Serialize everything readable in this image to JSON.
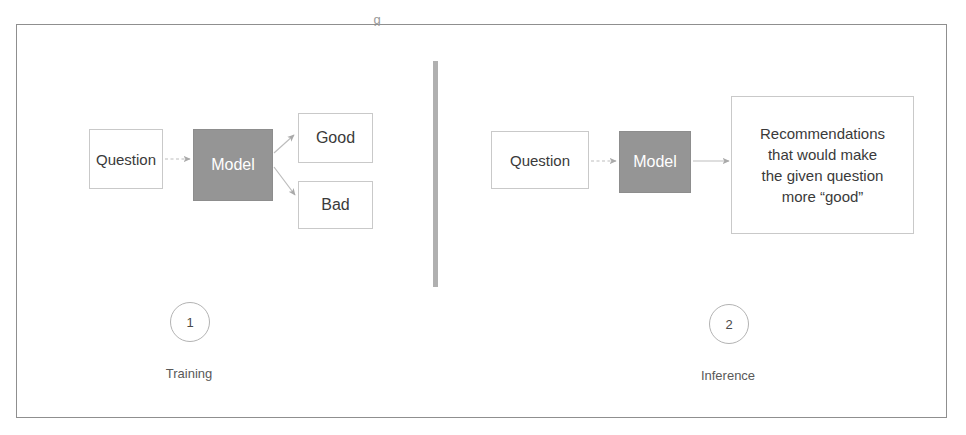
{
  "figure": {
    "cropped_caption_fragment": "g",
    "divider_color": "#b0b0b0",
    "frame_color": "#8f8f8f"
  },
  "colors": {
    "model_fill": "#959595",
    "box_border": "#c9c9c9",
    "text": "#3a3a3a",
    "model_text": "#ffffff",
    "arrow": "#aaaaaa"
  },
  "panels": [
    {
      "id": "training",
      "step_number": "1",
      "step_label": "Training",
      "nodes": {
        "input": "Question",
        "model": "Model",
        "outcome_positive": "Good",
        "outcome_negative": "Bad"
      }
    },
    {
      "id": "inference",
      "step_number": "2",
      "step_label": "Inference",
      "nodes": {
        "input": "Question",
        "model": "Model",
        "output_line_1": "Recommendations",
        "output_line_2": "that would make",
        "output_line_3": "the given question",
        "output_line_4": "more “good”"
      }
    }
  ]
}
